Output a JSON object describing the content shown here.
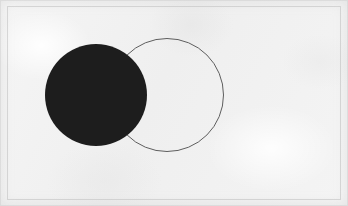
{
  "image": {
    "title": "Two overlapping circles",
    "width": 348,
    "height": 206,
    "background_color": "#f2f2f2",
    "frame_color": "#bebebe",
    "medium_note": "scanned paper texture"
  },
  "figure": {
    "caption": "Overlapping circle diagram",
    "shapes": [
      {
        "id": "filled-circle",
        "name": "black-filled-circle",
        "style": "filled",
        "fill_color": "#1d1d1d",
        "stroke_color": "none",
        "stroke_width": 0,
        "center_x": 96,
        "center_y": 95,
        "radius": 51
      },
      {
        "id": "outline-circle",
        "name": "outlined-circle",
        "style": "outline",
        "fill_color": "none",
        "stroke_color": "#5e5e5e",
        "stroke_width": 1,
        "center_x": 167,
        "center_y": 95,
        "radius": 56.5
      }
    ],
    "relationship": "overlapping",
    "overlap_note": "The black filled circle covers the left portion of the outlined circle"
  }
}
